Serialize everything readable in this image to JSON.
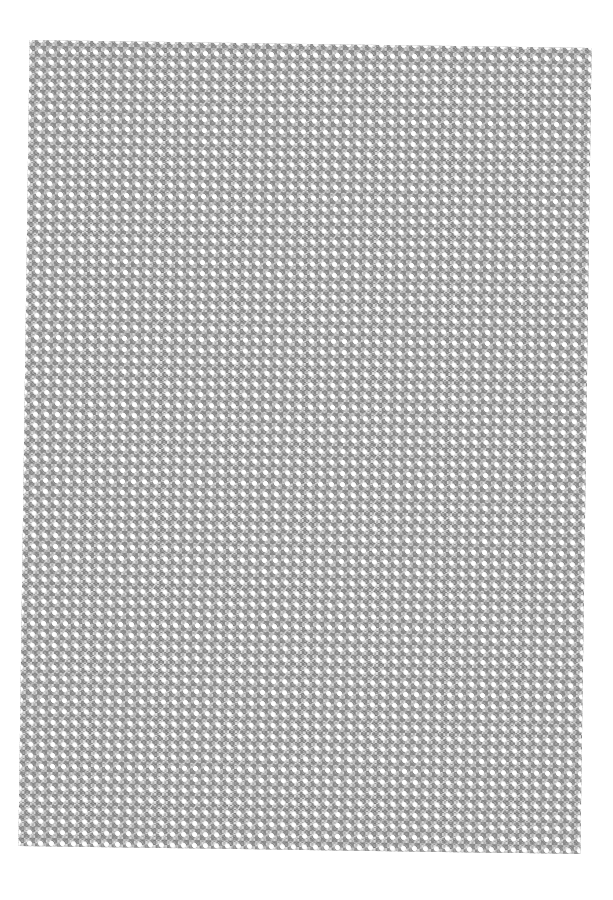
{
  "image": {
    "description": "Scanned sheet of gray diagonal lattice patterned paper on white background",
    "pattern": {
      "type": "diagonal-lattice",
      "cell_size_px": 11,
      "colors": {
        "background": "#ffffff",
        "sheet_base": "#d6d6d6",
        "dark_cells": "#9a9a9a",
        "holes": "#ffffff"
      }
    },
    "sheet_bounds": {
      "left": 24,
      "top": 44,
      "width": 562,
      "height": 806,
      "rotation_deg": 0.8
    }
  }
}
